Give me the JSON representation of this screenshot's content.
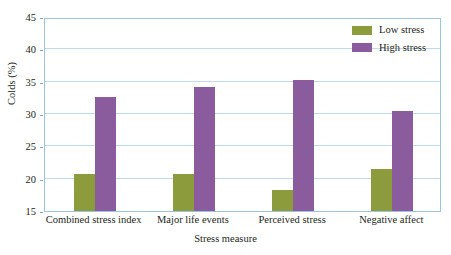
{
  "chart_data": {
    "type": "bar",
    "title": "",
    "xlabel": "Stress measure",
    "ylabel": "Colds (%)",
    "categories": [
      "Combined stress index",
      "Major life events",
      "Perceived stress",
      "Negative affect"
    ],
    "series": [
      {
        "name": "Low stress",
        "color": "#8c9c3d",
        "values": [
          20.7,
          20.8,
          18.2,
          21.5
        ]
      },
      {
        "name": "High stress",
        "color": "#8b5c9d",
        "values": [
          32.6,
          34.2,
          35.3,
          30.4
        ]
      }
    ],
    "ylim": [
      15,
      45
    ],
    "yticks": [
      15,
      20,
      25,
      30,
      35,
      40,
      45
    ],
    "ytick_labels": [
      "15",
      "20",
      "25",
      "30",
      "35",
      "40",
      "45"
    ],
    "grid": true,
    "legend_position": "top-right-inside",
    "axis_color": "#9cc3e0",
    "grid_color": "#bfd8ec",
    "background": "#ffffff"
  }
}
